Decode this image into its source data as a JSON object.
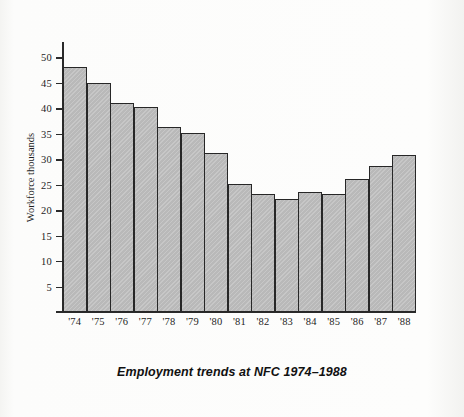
{
  "figure": {
    "caption": "Employment trends at NFC 1974–1988",
    "y_axis_title": "Workforce thousands",
    "bar_fill_color": "#b9b9b9",
    "bar_edge_color": "#272727",
    "background_color": "#fcfcfb"
  },
  "chart_data": {
    "type": "bar",
    "title": "Employment trends at NFC 1974–1988",
    "xlabel": "",
    "ylabel": "Workforce thousands",
    "categories": [
      "'74",
      "'75",
      "'76",
      "'77",
      "'78",
      "'79",
      "'80",
      "'81",
      "'82",
      "'83",
      "'84",
      "'85",
      "'86",
      "'87",
      "'88"
    ],
    "values": [
      48.0,
      45.0,
      41.0,
      40.2,
      36.3,
      35.2,
      31.2,
      25.2,
      23.2,
      22.2,
      23.5,
      23.1,
      26.1,
      28.7,
      30.9
    ],
    "ylim": [
      0,
      53
    ],
    "yticks": [
      5,
      10,
      15,
      20,
      25,
      30,
      35,
      40,
      45,
      50
    ],
    "ytick_labels": [
      "5",
      "10",
      "15",
      "20",
      "25",
      "30",
      "35",
      "40",
      "45",
      "50"
    ],
    "grid": false,
    "legend": null
  }
}
